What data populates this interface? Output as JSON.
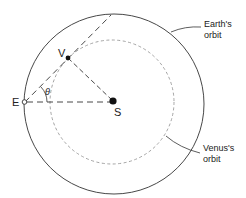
{
  "diagram": {
    "labels": {
      "earth_point": "E",
      "venus_point": "V",
      "sun_point": "S",
      "angle": "θ",
      "earth_orbit_line1": "Earth's",
      "earth_orbit_line2": "orbit",
      "venus_orbit_line1": "Venus's",
      "venus_orbit_line2": "orbit"
    },
    "colors": {
      "earth_orbit": "#333333",
      "venus_orbit": "#9a9a9a",
      "lines": "#333333",
      "points": "#111111"
    }
  }
}
